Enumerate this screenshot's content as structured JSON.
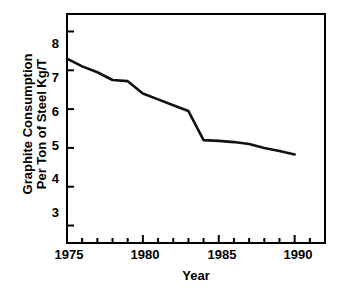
{
  "chart_data": {
    "type": "line",
    "title": "",
    "xlabel": "Year",
    "ylabel": "Graphite Consumption Per Ton of Steel Kg/T",
    "ylabel_lines": [
      "Graphite Consumption",
      "Per Ton of Steel Kg/T"
    ],
    "xlim": [
      1975,
      1992
    ],
    "ylim": [
      2.55,
      8.45
    ],
    "grid": false,
    "legend": "none",
    "x_tick_labels": [
      "1975",
      "1980",
      "1985",
      "1990"
    ],
    "x_tick_values": [
      1975,
      1980,
      1985,
      1990
    ],
    "x_minor_tick_values": [
      1976,
      1977,
      1978,
      1979,
      1981,
      1982,
      1983,
      1984,
      1986,
      1987,
      1988,
      1989,
      1991
    ],
    "y_tick_labels": [
      "3",
      "4",
      "5",
      "6",
      "7",
      "8"
    ],
    "y_tick_values": [
      3,
      4,
      5,
      6,
      7,
      8
    ],
    "x": [
      1975,
      1976,
      1977,
      1978,
      1979,
      1980,
      1981,
      1982,
      1983,
      1984,
      1985,
      1986,
      1987,
      1988,
      1989,
      1990
    ],
    "values": [
      7.3,
      7.1,
      6.95,
      6.75,
      6.72,
      6.4,
      6.25,
      6.1,
      5.95,
      5.2,
      5.18,
      5.15,
      5.1,
      5.0,
      4.92,
      4.83
    ],
    "series": [
      {
        "name": "Graphite Consumption Per Ton of Steel",
        "values": [
          7.3,
          7.1,
          6.95,
          6.75,
          6.72,
          6.4,
          6.25,
          6.1,
          5.95,
          5.2,
          5.18,
          5.15,
          5.1,
          5.0,
          4.92,
          4.83
        ]
      }
    ],
    "line_color": "#111111",
    "line_width": 2.6,
    "background_color": "#ffffff",
    "axis_color": "#000000"
  }
}
